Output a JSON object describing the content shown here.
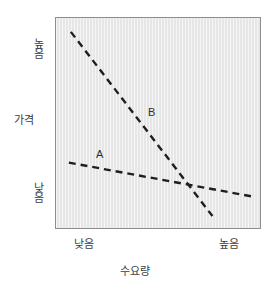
{
  "chart_data": {
    "type": "line",
    "title": "",
    "xlabel": "수요량",
    "ylabel": "가격",
    "grid": false,
    "legend_position": "inline-annotation",
    "x_tick_labels": [
      "낮음",
      "높음"
    ],
    "y_tick_labels": [
      "낮음",
      "높음"
    ],
    "xlim": [
      0,
      1
    ],
    "ylim": [
      0,
      1
    ],
    "plot_background_color": "#e9e9e9",
    "line_color": "#1e1e1e",
    "line_style": "dashed",
    "series": [
      {
        "name": "A",
        "label": "A",
        "description": "shallow downward-sloping demand curve (inelastic)",
        "x": [
          0.063,
          1.0
        ],
        "y": [
          0.311,
          0.151
        ],
        "points_px": [
          [
            68,
            163
          ],
          [
            252,
            197
          ]
        ]
      },
      {
        "name": "B",
        "label": "B",
        "description": "steep downward-sloping demand curve (elastic)",
        "x": [
          0.073,
          0.767
        ],
        "y": [
          0.934,
          0.057
        ],
        "points_px": [
          [
            70,
            31
          ],
          [
            213,
            217
          ]
        ]
      }
    ],
    "annotations": [
      {
        "text": "A",
        "x_px": 100,
        "y_px": 156
      },
      {
        "text": "B",
        "x_px": 152,
        "y_px": 114
      }
    ],
    "intersection_px": [
      205,
      190
    ]
  },
  "axes": {
    "y": {
      "title": "가격",
      "tick_high": "높음",
      "tick_low": "낮음"
    },
    "x": {
      "title": "수요량",
      "tick_low": "낮음",
      "tick_high": "높음"
    }
  },
  "curves": {
    "a_label": "A",
    "b_label": "B"
  }
}
